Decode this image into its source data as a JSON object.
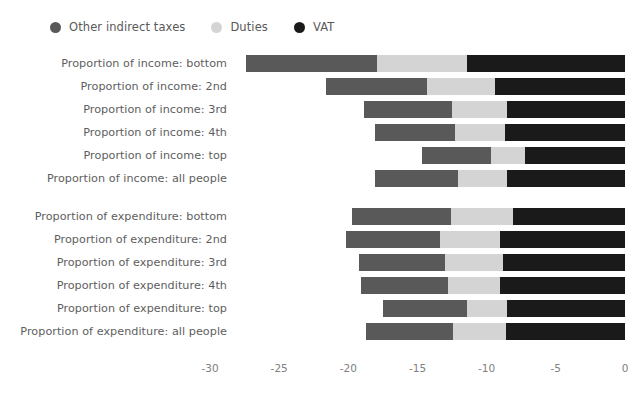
{
  "chart_data": {
    "type": "bar",
    "orientation": "horizontal",
    "stacked": true,
    "title": "",
    "subtitle": "",
    "xlabel": "",
    "ylabel": "",
    "xlim": [
      -30,
      0
    ],
    "xticks": [
      -30,
      -25,
      -20,
      -15,
      -10,
      -5,
      0
    ],
    "xtick_labels": [
      "-30",
      "-25",
      "-20",
      "-15",
      "-10",
      "-5",
      "0"
    ],
    "grid": false,
    "legend_position": "top-left",
    "legend": [
      {
        "label": "Other indirect taxes",
        "color": "#595959",
        "key": "other_indirect_taxes"
      },
      {
        "label": "Duties",
        "color": "#d4d4d4",
        "key": "duties"
      },
      {
        "label": "VAT",
        "color": "#1a1a1a",
        "key": "vat"
      }
    ],
    "categories": [
      "Proportion of income: bottom",
      "Proportion of income: 2nd",
      "Proportion of income: 3rd",
      "Proportion of income: 4th",
      "Proportion of income: top",
      "Proportion of income: all people",
      "Proportion of expenditure: bottom",
      "Proportion of expenditure: 2nd",
      "Proportion of expenditure: 3rd",
      "Proportion of expenditure: 4th",
      "Proportion of expenditure: top",
      "Proportion of expenditure: all people"
    ],
    "series": [
      {
        "name": "Other indirect taxes",
        "color": "#595959",
        "values": [
          -9.5,
          -7.3,
          -6.4,
          -5.8,
          -5.0,
          -6.0,
          -7.1,
          -6.8,
          -6.2,
          -6.3,
          -6.1,
          -6.3
        ]
      },
      {
        "name": "Duties",
        "color": "#d4d4d4",
        "values": [
          -6.5,
          -4.9,
          -4.0,
          -3.6,
          -2.5,
          -3.6,
          -4.5,
          -4.4,
          -4.2,
          -3.8,
          -2.9,
          -3.8
        ]
      },
      {
        "name": "VAT",
        "color": "#1a1a1a",
        "values": [
          -11.4,
          -9.4,
          -8.5,
          -8.7,
          -7.2,
          -8.5,
          -8.1,
          -9.0,
          -8.8,
          -9.0,
          -8.5,
          -8.6
        ]
      }
    ],
    "totals": [
      -27.4,
      -21.6,
      -18.9,
      -18.1,
      -14.7,
      -18.1,
      -19.7,
      -20.2,
      -19.2,
      -19.0,
      -17.4,
      -18.7
    ],
    "group_gap_after_index": 5
  },
  "layout": {
    "plot_left_px": 229,
    "plot_right_px": 625,
    "value_zero_px": 625,
    "px_per_unit": 13.833
  }
}
